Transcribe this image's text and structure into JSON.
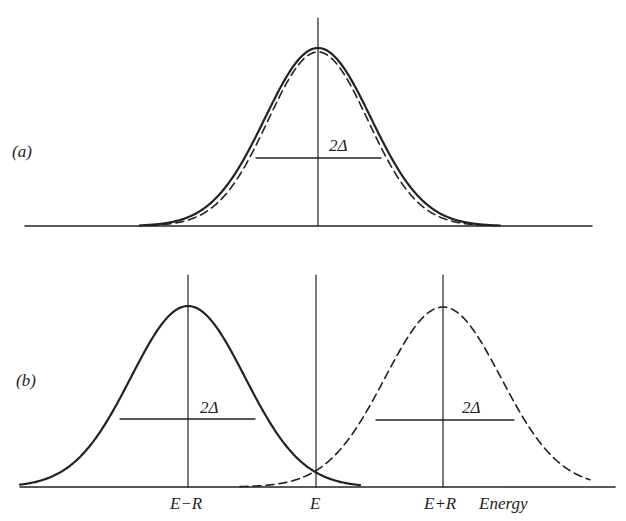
{
  "figure": {
    "panel_a": {
      "label": "(a)",
      "width_label": "2Δ"
    },
    "panel_b": {
      "label": "(b)",
      "left_width_label": "2Δ",
      "right_width_label": "2Δ",
      "x_ticks": [
        "E−R",
        "E",
        "E+R"
      ],
      "x_axis_label": "Energy"
    },
    "colors": {
      "line": "#222222",
      "background": "#ffffff"
    }
  },
  "chart_data": [
    {
      "type": "line",
      "title": "(a)",
      "series": [
        {
          "name": "solid Gaussian",
          "style": "solid",
          "center": "E",
          "fwhm": "2Δ"
        },
        {
          "name": "dashed Gaussian",
          "style": "dashed",
          "center": "E",
          "fwhm": "2Δ"
        }
      ],
      "annotations": [
        "2Δ"
      ]
    },
    {
      "type": "line",
      "title": "(b)",
      "xlabel": "Energy",
      "categories": [
        "E−R",
        "E",
        "E+R"
      ],
      "series": [
        {
          "name": "solid Gaussian",
          "style": "solid",
          "center": "E−R",
          "fwhm": "2Δ"
        },
        {
          "name": "dashed Gaussian",
          "style": "dashed",
          "center": "E+R",
          "fwhm": "2Δ"
        }
      ],
      "annotations": [
        "2Δ",
        "2Δ"
      ]
    }
  ]
}
